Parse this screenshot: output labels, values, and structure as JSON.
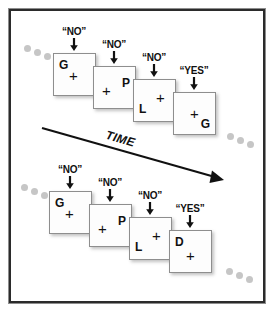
{
  "figure": {
    "time_label": "TIME",
    "frame_color": "#b4b4b4",
    "panel_color": "#ffffff",
    "ink_color": "#111111",
    "dot_color": "#c6c6c6"
  },
  "sequences": [
    {
      "name": "top-sequence",
      "cards": [
        {
          "letter": "G",
          "letter_pos": "top-left",
          "fixation": "+",
          "response": "“NO”"
        },
        {
          "letter": "P",
          "letter_pos": "top-right",
          "fixation": "+",
          "response": "“NO”"
        },
        {
          "letter": "L",
          "letter_pos": "bottom-left",
          "fixation": "+",
          "response": "“NO”"
        },
        {
          "letter": "G",
          "letter_pos": "bottom-right",
          "fixation": "+",
          "response": "“YES”"
        }
      ]
    },
    {
      "name": "bottom-sequence",
      "cards": [
        {
          "letter": "G",
          "letter_pos": "top-left",
          "fixation": "+",
          "response": "“NO”"
        },
        {
          "letter": "P",
          "letter_pos": "top-right",
          "fixation": "+",
          "response": "“NO”"
        },
        {
          "letter": "L",
          "letter_pos": "bottom-left",
          "fixation": "+",
          "response": "“NO”"
        },
        {
          "letter": "D",
          "letter_pos": "top-left",
          "fixation": "+",
          "response": "“YES”"
        }
      ]
    }
  ]
}
